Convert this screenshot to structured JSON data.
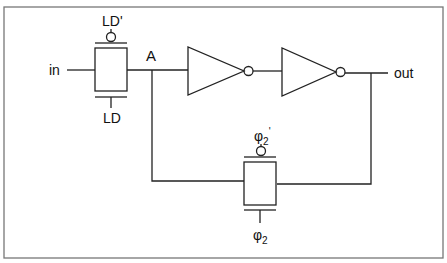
{
  "diagram": {
    "type": "circuit-schematic",
    "labels": {
      "input": "in",
      "output": "out",
      "node_a": "A",
      "gate1_top": "LD'",
      "gate1_bottom": "LD",
      "gate2_top_base": "φ",
      "gate2_top_sub": "2",
      "gate2_top_prime": "'",
      "gate2_bottom_base": "φ",
      "gate2_bottom_sub": "2"
    },
    "components": [
      {
        "id": "tg1",
        "kind": "transmission-gate",
        "control_top": "LD'",
        "control_bottom": "LD"
      },
      {
        "id": "inv1",
        "kind": "inverter"
      },
      {
        "id": "inv2",
        "kind": "inverter"
      },
      {
        "id": "tg2",
        "kind": "transmission-gate",
        "control_top": "φ2'",
        "control_bottom": "φ2"
      }
    ],
    "colors": {
      "line": "#222222",
      "frame": "#777777",
      "background": "#ffffff"
    }
  }
}
